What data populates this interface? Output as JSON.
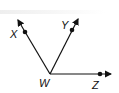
{
  "diagram": {
    "vertex": {
      "label": "W"
    },
    "rays": [
      {
        "label": "X"
      },
      {
        "label": "Y"
      },
      {
        "label": "Z"
      }
    ]
  }
}
